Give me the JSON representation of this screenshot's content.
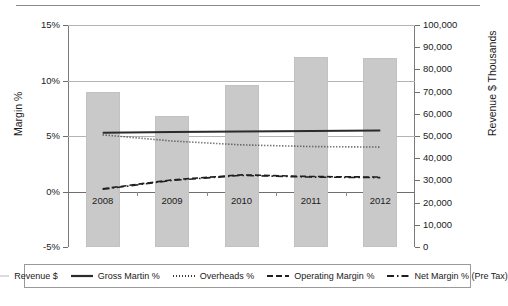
{
  "chart_data": {
    "type": "bar",
    "title": "",
    "xlabel": "",
    "ylabel": "Margin %",
    "y2label": "Revenue $ Thousands",
    "categories": [
      "2008",
      "2009",
      "2010",
      "2011",
      "2012"
    ],
    "ylim": [
      -5,
      15
    ],
    "y2lim": [
      0,
      100000
    ],
    "yticks": [
      "-5%",
      "0%",
      "5%",
      "10%",
      "15%"
    ],
    "y2ticks": [
      "0",
      "10,000",
      "20,000",
      "30,000",
      "40,000",
      "50,000",
      "60,000",
      "70,000",
      "80,000",
      "90,000",
      "100,000"
    ],
    "grid": true,
    "legend_position": "bottom",
    "series": [
      {
        "name": "Revenue $",
        "axis": "right",
        "style": "bar",
        "color": "#c9c9c9",
        "values": [
          70000,
          59000,
          73000,
          85500,
          85000
        ]
      },
      {
        "name": "Gross Martin %",
        "axis": "left",
        "style": "solid",
        "color": "#2b2b2b",
        "values": [
          5.3,
          5.35,
          5.4,
          5.45,
          5.5
        ]
      },
      {
        "name": "Overheads %",
        "axis": "left",
        "style": "dotted",
        "color": "#3a3a3a",
        "values": [
          5.1,
          4.55,
          4.2,
          4.05,
          4.0
        ]
      },
      {
        "name": "Operating Margin %",
        "axis": "left",
        "style": "dashed",
        "color": "#1f1f1f",
        "values": [
          0.25,
          1.05,
          1.5,
          1.35,
          1.3
        ]
      },
      {
        "name": "Net Margin % (Pre Tax)",
        "axis": "left",
        "style": "dashdot",
        "color": "#1f1f1f",
        "values": [
          0.2,
          1.0,
          1.45,
          1.3,
          1.25
        ]
      }
    ]
  },
  "legend": {
    "items": [
      {
        "label": "Revenue $",
        "swatch": "thin-line-swatch"
      },
      {
        "label": "Gross Martin %",
        "swatch": "solid-line-swatch"
      },
      {
        "label": "Overheads %",
        "swatch": "dotted-line-swatch"
      },
      {
        "label": "Operating Margin %",
        "swatch": "dashed-line-swatch"
      },
      {
        "label": "Net Margin % (Pre Tax)",
        "swatch": "dashdot-line-swatch"
      }
    ]
  }
}
